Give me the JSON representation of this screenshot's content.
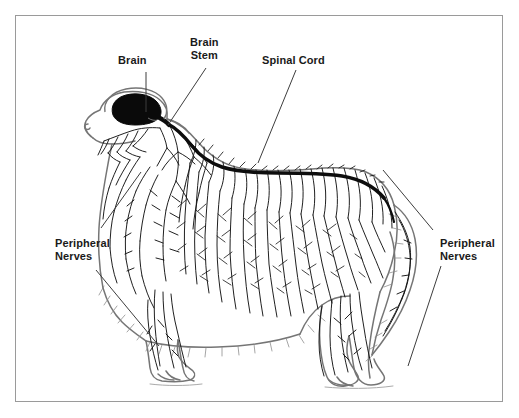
{
  "figure": {
    "background_color": "#ffffff",
    "frame_color": "#9a9a9a",
    "ink_color": "#1a1a1a",
    "label_color": "#1a1a1a"
  },
  "labels": {
    "brain": "Brain",
    "brain_stem": "Brain\nStem",
    "spinal_cord": "Spinal Cord",
    "peripheral_nerves_left": "Peripheral\nNerves",
    "peripheral_nerves_right": "Peripheral\nNerves"
  },
  "annotations": [
    {
      "id": "brain",
      "text": "Brain",
      "label_x": 118,
      "label_y": 54,
      "leader": [
        [
          146,
          72
        ],
        [
          146,
          112
        ]
      ]
    },
    {
      "id": "brain-stem",
      "text": "Brain Stem",
      "label_x": 190,
      "label_y": 36,
      "leader": [
        [
          206,
          68
        ],
        [
          168,
          125
        ]
      ]
    },
    {
      "id": "spinal-cord",
      "text": "Spinal Cord",
      "label_x": 262,
      "label_y": 54,
      "leader": [
        [
          296,
          70
        ],
        [
          258,
          163
        ]
      ]
    },
    {
      "id": "peripheral-nerves-left-upper",
      "text": "Peripheral Nerves",
      "label_x": 55,
      "label_y": 237,
      "leader": [
        [
          101,
          228
        ],
        [
          141,
          172
        ]
      ]
    },
    {
      "id": "peripheral-nerves-left-lower",
      "text": "Peripheral Nerves",
      "label_x": 55,
      "label_y": 237,
      "leader": [
        [
          96,
          270
        ],
        [
          159,
          346
        ]
      ]
    },
    {
      "id": "peripheral-nerves-right-upper",
      "text": "Peripheral Nerves",
      "label_x": 440,
      "label_y": 237,
      "leader": [
        [
          433,
          230
        ],
        [
          383,
          170
        ]
      ]
    },
    {
      "id": "peripheral-nerves-right-lower",
      "text": "Peripheral Nerves",
      "label_x": 440,
      "label_y": 237,
      "leader": [
        [
          441,
          266
        ],
        [
          408,
          366
        ]
      ]
    }
  ],
  "structures": [
    {
      "name": "brain",
      "style": "solid-black-fill",
      "description": "Filled black mass inside cranium"
    },
    {
      "name": "brain-stem",
      "style": "thick-black-stroke",
      "description": "Thick dark band leaving caudal brain"
    },
    {
      "name": "spinal-cord",
      "style": "thick-black-stroke",
      "description": "Thick dark line running along the dorsal midline from neck to tail base"
    },
    {
      "name": "peripheral-nerves",
      "style": "thin-branching-strokes",
      "description": "Fine branching nerve tracery over neck, trunk, limbs and tail"
    },
    {
      "name": "dog-outline",
      "style": "gray-contour",
      "description": "Lateral silhouette of a long-coated dog standing"
    }
  ]
}
